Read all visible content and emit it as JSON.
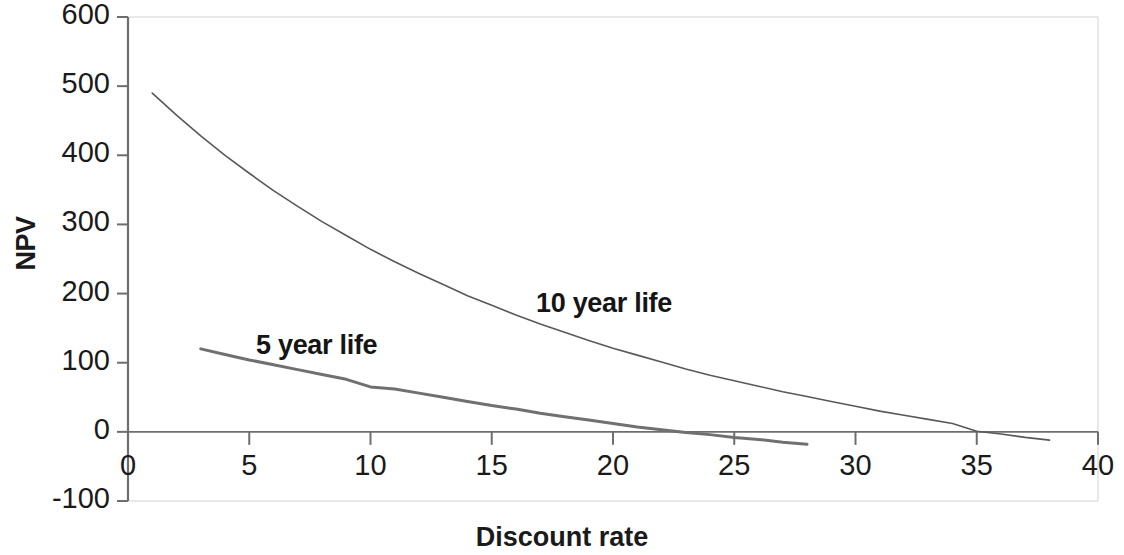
{
  "chart_data": {
    "type": "line",
    "title": "",
    "xlabel": "Discount rate",
    "ylabel": "NPV",
    "xlim": [
      0,
      40
    ],
    "ylim": [
      -100,
      600
    ],
    "xticks": [
      0,
      5,
      10,
      15,
      20,
      25,
      30,
      35,
      40
    ],
    "yticks": [
      -100,
      0,
      100,
      200,
      300,
      400,
      500,
      600
    ],
    "xtick_labels": [
      "0",
      "5",
      "10",
      "15",
      "20",
      "25",
      "30",
      "35",
      "40"
    ],
    "ytick_labels": [
      "-100",
      "0",
      "100",
      "200",
      "300",
      "400",
      "500",
      "600"
    ],
    "grid": false,
    "legend_position": "inline-annotations",
    "annotations": [
      {
        "text": "5 year life",
        "x": 10.5,
        "y": 140
      },
      {
        "text": "10 year life",
        "x": 22.0,
        "y": 200
      }
    ],
    "series": [
      {
        "name": "10 year life",
        "color": "#595959",
        "width": 1.6,
        "x": [
          1,
          2,
          3,
          4,
          5,
          6,
          7,
          8,
          9,
          10,
          11,
          12,
          13,
          14,
          15,
          16,
          17,
          18,
          19,
          20,
          21,
          22,
          23,
          24,
          25,
          26,
          27,
          28,
          29,
          30,
          31,
          32,
          33,
          34,
          35,
          36,
          37,
          38
        ],
        "y": [
          490,
          458,
          428,
          400,
          374,
          349,
          326,
          304,
          284,
          264,
          246,
          229,
          213,
          197,
          183,
          169,
          156,
          144,
          132,
          121,
          111,
          101,
          91,
          82,
          74,
          66,
          58,
          51,
          44,
          37,
          30,
          24,
          18,
          12,
          1,
          -3,
          -8,
          -12
        ]
      },
      {
        "name": "5 year life",
        "color": "#707070",
        "width": 3.0,
        "x": [
          3,
          4,
          5,
          6,
          7,
          8,
          9,
          10,
          11,
          12,
          13,
          14,
          15,
          16,
          17,
          18,
          19,
          20,
          21,
          22,
          23,
          24,
          25,
          26,
          27,
          28
        ],
        "y": [
          120,
          112,
          104,
          97,
          90,
          83,
          76,
          65,
          62,
          56,
          50,
          44,
          38,
          33,
          27,
          22,
          17,
          12,
          7,
          3,
          -1,
          -4,
          -8,
          -11,
          -15,
          -18
        ]
      }
    ]
  },
  "axis": {
    "y_title": "NPV",
    "x_title": "Discount rate"
  },
  "labels": {
    "five_year": "5 year life",
    "ten_year": "10 year life"
  },
  "style": {
    "background": "#ffffff",
    "axis_color": "#6e6e6e",
    "text_color": "#1a1a1a",
    "border_color": "#d8d8d8"
  }
}
